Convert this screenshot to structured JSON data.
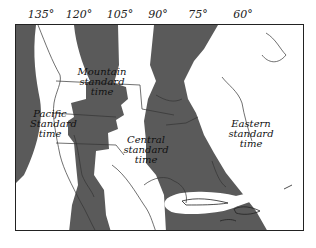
{
  "figure": {
    "type": "time-zone-map",
    "region": "North America",
    "longitude_labels": [
      "135°",
      "120°",
      "105°",
      "90°",
      "75°",
      "60°"
    ],
    "zones": [
      {
        "id": "pacific",
        "label": "Pacific\nStandard\ntime",
        "shaded": false
      },
      {
        "id": "mountain",
        "label": "Mountain\nstandard\ntime",
        "shaded": true
      },
      {
        "id": "central",
        "label": "Central\nstandard\ntime",
        "shaded": false
      },
      {
        "id": "eastern",
        "label": "Eastern\nstandard\ntime",
        "shaded": true
      }
    ],
    "colors": {
      "shade": "#5a5a5a",
      "land_outline": "#333333",
      "background": "#ffffff",
      "frame": "#222222"
    }
  }
}
